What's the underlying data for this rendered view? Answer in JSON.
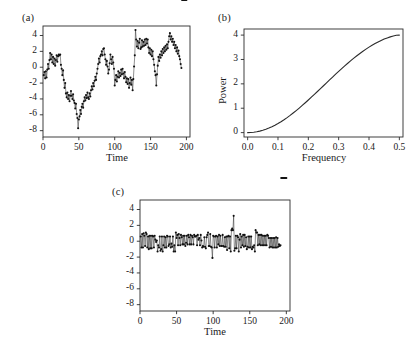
{
  "figure": {
    "background": "#ffffff",
    "ink": "#1a1a1a"
  },
  "panels": {
    "a": {
      "label": "(a)"
    },
    "b": {
      "label": "(b)"
    },
    "c": {
      "label": "(c)"
    }
  },
  "chart_data": [
    {
      "id": "panel-a",
      "type": "line",
      "title": "(a)",
      "xlabel": "Time",
      "ylabel": "",
      "xlim": [
        0,
        205
      ],
      "ylim": [
        -8.8,
        5.2
      ],
      "xticks": [
        0,
        50,
        100,
        150,
        200
      ],
      "xticklabels": [
        "0",
        "50",
        "100",
        "150",
        "200"
      ],
      "yticks": [
        4,
        2,
        0,
        -2,
        -4,
        -6,
        -8
      ],
      "yticklabels": [
        "4",
        "2",
        "0",
        "-2",
        "-4",
        "-6",
        "-8"
      ],
      "grid": false,
      "legend": null,
      "marker": "filled-circle",
      "series": [
        {
          "name": "random walk series",
          "x": [
            1,
            2,
            3,
            4,
            5,
            6,
            7,
            8,
            9,
            10,
            11,
            12,
            13,
            14,
            15,
            16,
            17,
            18,
            19,
            20,
            21,
            22,
            23,
            24,
            25,
            26,
            27,
            28,
            29,
            30,
            31,
            32,
            33,
            34,
            35,
            36,
            37,
            38,
            39,
            40,
            41,
            42,
            43,
            44,
            45,
            46,
            47,
            48,
            49,
            50,
            51,
            52,
            53,
            54,
            55,
            56,
            57,
            58,
            59,
            60,
            61,
            62,
            63,
            64,
            65,
            66,
            67,
            68,
            69,
            70,
            71,
            72,
            73,
            74,
            75,
            76,
            77,
            78,
            79,
            80,
            81,
            82,
            83,
            84,
            85,
            86,
            87,
            88,
            89,
            90,
            91,
            92,
            93,
            94,
            95,
            96,
            97,
            98,
            99,
            100,
            101,
            102,
            103,
            104,
            105,
            106,
            107,
            108,
            109,
            110,
            111,
            112,
            113,
            114,
            115,
            116,
            117,
            118,
            119,
            120,
            121,
            122,
            123,
            124,
            125,
            126,
            127,
            128,
            129,
            130,
            131,
            132,
            133,
            134,
            135,
            136,
            137,
            138,
            139,
            140,
            141,
            142,
            143,
            144,
            145,
            146,
            147,
            148,
            149,
            150,
            151,
            152,
            153,
            154,
            155,
            156,
            157,
            158,
            159,
            160,
            161,
            162,
            163,
            164,
            165,
            166,
            167,
            168,
            169,
            170,
            171,
            172,
            173,
            174,
            175,
            176,
            177,
            178,
            179,
            180,
            181,
            182,
            183,
            184,
            185,
            186,
            187,
            188,
            189,
            190,
            191,
            192,
            193,
            194,
            195,
            196,
            197,
            198,
            199,
            200
          ],
          "values": [
            -1.0,
            -0.6,
            -1.4,
            -0.5,
            -1.3,
            -0.3,
            0.4,
            -0.2,
            0.9,
            1.8,
            1.0,
            1.6,
            0.6,
            1.3,
            0.4,
            1.1,
            0.2,
            0.9,
            1.5,
            0.7,
            1.4,
            1.6,
            1.5,
            1.6,
            0.3,
            -0.2,
            -1.0,
            -0.4,
            -1.6,
            -2.6,
            -2.0,
            -3.3,
            -3.8,
            -3.2,
            -4.0,
            -3.5,
            -4.3,
            -3.6,
            -3.0,
            -3.6,
            -4.0,
            -3.4,
            -4.2,
            -4.5,
            -5.2,
            -4.6,
            -5.9,
            -6.4,
            -7.7,
            -6.6,
            -6.2,
            -5.4,
            -5.9,
            -5.0,
            -4.6,
            -5.1,
            -4.3,
            -3.8,
            -4.2,
            -3.5,
            -3.9,
            -3.2,
            -3.8,
            -4.0,
            -3.3,
            -3.7,
            -2.9,
            -2.4,
            -2.8,
            -2.0,
            -2.4,
            -1.7,
            -1.2,
            -1.6,
            -0.8,
            -0.2,
            0.4,
            1.1,
            0.6,
            1.4,
            1.6,
            2.0,
            1.5,
            2.3,
            2.4,
            1.6,
            1.0,
            0.3,
            0.8,
            0.1,
            -0.8,
            -0.3,
            0.5,
            1.6,
            1.0,
            0.4,
            1.3,
            0.6,
            -0.2,
            -2.3,
            -1.6,
            -1.0,
            -1.8,
            -1.2,
            -0.5,
            -1.3,
            -0.7,
            -1.1,
            -0.3,
            -0.9,
            -0.2,
            -0.8,
            -1.4,
            -0.6,
            -1.2,
            -1.9,
            -1.4,
            -2.1,
            -1.5,
            -2.6,
            -2.0,
            -1.3,
            -2.2,
            -1.6,
            -2.9,
            -1.5,
            0.1,
            1.5,
            4.7,
            3.5,
            2.6,
            3.3,
            2.4,
            3.1,
            3.6,
            2.3,
            2.5,
            3.4,
            2.6,
            3.2,
            2.7,
            3.5,
            2.8,
            3.6,
            3.0,
            3.5,
            2.5,
            1.8,
            2.4,
            1.6,
            2.2,
            1.4,
            2.0,
            1.0,
            0.3,
            -0.5,
            -1.0,
            -2.3,
            -0.9,
            0.2,
            1.3,
            0.8,
            1.6,
            1.2,
            2.0,
            1.5,
            2.3,
            1.8,
            2.5,
            2.0,
            2.7,
            2.2,
            2.9,
            2.4,
            3.2,
            3.9,
            4.3,
            3.5,
            3.9,
            3.2,
            3.6,
            2.8,
            3.2,
            2.4,
            2.8,
            2.0,
            2.5,
            1.7,
            2.1,
            1.4,
            1.0,
            0.4,
            -0.1
          ]
        }
      ]
    },
    {
      "id": "panel-b",
      "type": "line",
      "title": "(b)",
      "xlabel": "Frequency",
      "ylabel": "Power",
      "xlim": [
        -0.012,
        0.512
      ],
      "ylim": [
        -0.18,
        4.25
      ],
      "xticks": [
        0.0,
        0.1,
        0.2,
        0.3,
        0.4,
        0.5
      ],
      "xticklabels": [
        "0.0",
        "0.1",
        "0.2",
        "0.3",
        "0.4",
        "0.5"
      ],
      "yticks": [
        0,
        1,
        2,
        3,
        4
      ],
      "yticklabels": [
        "0",
        "1",
        "2",
        "3",
        "4"
      ],
      "grid": false,
      "legend": null,
      "marker": "none",
      "series": [
        {
          "name": "spectral density",
          "x": [
            0.0,
            0.01,
            0.02,
            0.03,
            0.04,
            0.05,
            0.06,
            0.07,
            0.08,
            0.09,
            0.1,
            0.11,
            0.12,
            0.13,
            0.14,
            0.15,
            0.16,
            0.17,
            0.18,
            0.19,
            0.2,
            0.21,
            0.22,
            0.23,
            0.24,
            0.25,
            0.26,
            0.27,
            0.28,
            0.29,
            0.3,
            0.31,
            0.32,
            0.33,
            0.34,
            0.35,
            0.36,
            0.37,
            0.38,
            0.39,
            0.4,
            0.41,
            0.42,
            0.43,
            0.44,
            0.45,
            0.46,
            0.47,
            0.48,
            0.49,
            0.5
          ],
          "values": [
            0.0,
            0.004,
            0.016,
            0.035,
            0.062,
            0.096,
            0.138,
            0.187,
            0.243,
            0.305,
            0.374,
            0.449,
            0.53,
            0.616,
            0.707,
            0.803,
            0.903,
            1.007,
            1.114,
            1.224,
            1.337,
            1.452,
            1.568,
            1.686,
            1.804,
            1.923,
            2.042,
            2.161,
            2.279,
            2.396,
            2.511,
            2.625,
            2.736,
            2.845,
            2.951,
            3.053,
            3.152,
            3.247,
            3.338,
            3.424,
            3.506,
            3.583,
            3.654,
            3.72,
            3.781,
            3.836,
            3.884,
            3.927,
            3.963,
            3.992,
            4.0
          ]
        }
      ]
    },
    {
      "id": "panel-c",
      "type": "line",
      "title": "(c)",
      "xlabel": "Time",
      "ylabel": "",
      "xlim": [
        0,
        205
      ],
      "ylim": [
        -8.8,
        5.2
      ],
      "xticks": [
        0,
        50,
        100,
        150,
        200
      ],
      "xticklabels": [
        "0",
        "50",
        "100",
        "150",
        "200"
      ],
      "yticks": [
        4,
        2,
        0,
        -2,
        -4,
        -6,
        -8
      ],
      "yticklabels": [
        "4",
        "2",
        "0",
        "-2",
        "-4",
        "-6",
        "-8"
      ],
      "grid": false,
      "legend": null,
      "marker": "filled-circle",
      "series": [
        {
          "name": "differenced series",
          "x": [
            1,
            2,
            3,
            4,
            5,
            6,
            7,
            8,
            9,
            10,
            11,
            12,
            13,
            14,
            15,
            16,
            17,
            18,
            19,
            20,
            21,
            22,
            23,
            24,
            25,
            26,
            27,
            28,
            29,
            30,
            31,
            32,
            33,
            34,
            35,
            36,
            37,
            38,
            39,
            40,
            41,
            42,
            43,
            44,
            45,
            46,
            47,
            48,
            49,
            50,
            51,
            52,
            53,
            54,
            55,
            56,
            57,
            58,
            59,
            60,
            61,
            62,
            63,
            64,
            65,
            66,
            67,
            68,
            69,
            70,
            71,
            72,
            73,
            74,
            75,
            76,
            77,
            78,
            79,
            80,
            81,
            82,
            83,
            84,
            85,
            86,
            87,
            88,
            89,
            90,
            91,
            92,
            93,
            94,
            95,
            96,
            97,
            98,
            99,
            100,
            101,
            102,
            103,
            104,
            105,
            106,
            107,
            108,
            109,
            110,
            111,
            112,
            113,
            114,
            115,
            116,
            117,
            118,
            119,
            120,
            121,
            122,
            123,
            124,
            125,
            126,
            127,
            128,
            129,
            130,
            131,
            132,
            133,
            134,
            135,
            136,
            137,
            138,
            139,
            140,
            141,
            142,
            143,
            144,
            145,
            146,
            147,
            148,
            149,
            150,
            151,
            152,
            153,
            154,
            155,
            156,
            157,
            158,
            159,
            160,
            161,
            162,
            163,
            164,
            165,
            166,
            167,
            168,
            169,
            170,
            171,
            172,
            173,
            174,
            175,
            176,
            177,
            178,
            179,
            180,
            181,
            182,
            183,
            184,
            185,
            186,
            187,
            188,
            189,
            190,
            191,
            192,
            193,
            194,
            195,
            196,
            197,
            198,
            199,
            200
          ],
          "values": [
            0.6,
            -0.8,
            0.9,
            -0.8,
            1.0,
            0.7,
            -0.6,
            1.1,
            0.9,
            -0.8,
            0.6,
            -1.0,
            0.7,
            -0.9,
            0.7,
            -0.9,
            0.7,
            0.6,
            -0.8,
            0.7,
            0.2,
            -0.1,
            0.1,
            -1.3,
            -0.5,
            -0.8,
            0.6,
            -1.2,
            -1.0,
            0.6,
            -1.3,
            -0.5,
            0.6,
            -0.8,
            0.5,
            -0.8,
            0.7,
            0.6,
            -0.6,
            -0.4,
            0.6,
            -0.8,
            -0.3,
            -0.7,
            0.6,
            -1.3,
            -0.5,
            -1.3,
            1.1,
            0.4,
            0.8,
            -0.5,
            0.9,
            0.4,
            -0.5,
            0.8,
            0.5,
            -0.4,
            0.7,
            -0.4,
            0.7,
            -0.6,
            -0.2,
            0.7,
            -0.4,
            0.8,
            0.5,
            -0.4,
            0.8,
            -0.4,
            0.7,
            0.5,
            -0.4,
            0.8,
            0.6,
            0.6,
            0.7,
            -0.5,
            0.8,
            0.2,
            0.4,
            -0.5,
            0.8,
            0.1,
            -0.8,
            -0.6,
            -0.7,
            0.5,
            -0.7,
            -0.9,
            0.5,
            0.8,
            1.1,
            -0.6,
            -0.6,
            0.9,
            -0.7,
            -0.8,
            -2.1,
            0.7,
            0.6,
            -0.8,
            0.6,
            0.7,
            -0.8,
            0.6,
            -0.4,
            0.8,
            -0.6,
            0.7,
            -0.6,
            -0.6,
            0.8,
            -0.6,
            -0.7,
            0.5,
            -0.7,
            0.6,
            -1.1,
            0.6,
            0.7,
            -0.9,
            0.6,
            -1.3,
            1.4,
            1.6,
            1.4,
            3.2,
            -1.2,
            -0.9,
            0.7,
            -0.9,
            0.7,
            0.5,
            -1.3,
            0.2,
            0.9,
            -0.8,
            0.6,
            -0.5,
            0.8,
            -0.7,
            0.8,
            -0.6,
            0.5,
            -1.0,
            -0.7,
            0.6,
            -0.8,
            0.6,
            -0.8,
            0.6,
            -1.0,
            -0.7,
            -0.8,
            -0.5,
            -1.3,
            1.4,
            1.1,
            1.1,
            -0.5,
            0.8,
            -0.4,
            0.8,
            -0.5,
            0.8,
            -0.5,
            0.7,
            -0.5,
            0.7,
            -0.5,
            0.7,
            -0.5,
            0.8,
            0.7,
            0.4,
            -0.8,
            0.4,
            -0.7,
            0.4,
            -0.8,
            0.4,
            -0.8,
            0.4,
            -0.8,
            0.5,
            -0.8,
            0.4,
            -0.7,
            -0.4,
            -0.6,
            -0.5
          ]
        }
      ]
    }
  ]
}
